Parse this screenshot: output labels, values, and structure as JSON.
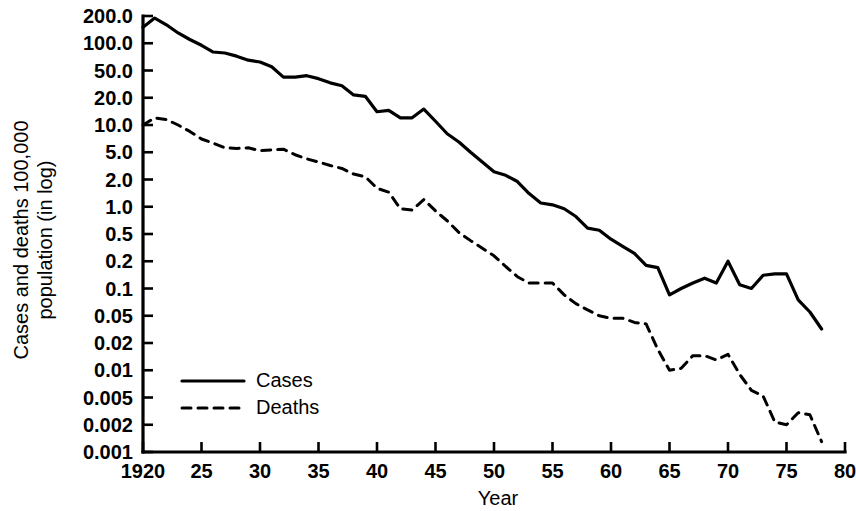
{
  "chart_data": {
    "type": "line",
    "title": "",
    "xlabel": "Year",
    "ylabel": "Cases and deaths 100,000 population (in log)",
    "yscale": "log",
    "ylim": [
      0.001,
      200.0
    ],
    "xlim": [
      1920,
      1980
    ],
    "grid": false,
    "legend_position": "inside-lower-left",
    "y_tick_labels": [
      "200.0",
      "100.0",
      "50.0",
      "20.0",
      "10.0",
      "5.0",
      "2.0",
      "1.0",
      "0.5",
      "0.2",
      "0.1",
      "0.05",
      "0.02",
      "0.01",
      "0.005",
      "0.002",
      "0.001"
    ],
    "y_tick_values": [
      200.0,
      100.0,
      50.0,
      20.0,
      10.0,
      5.0,
      2.0,
      1.0,
      0.5,
      0.2,
      0.1,
      0.05,
      0.02,
      0.01,
      0.005,
      0.002,
      0.001
    ],
    "x_tick_labels": [
      "1920",
      "25",
      "30",
      "35",
      "40",
      "45",
      "50",
      "55",
      "60",
      "65",
      "70",
      "75",
      "80"
    ],
    "x_tick_values": [
      1920,
      1925,
      1930,
      1935,
      1940,
      1945,
      1950,
      1955,
      1960,
      1965,
      1970,
      1975,
      1980
    ],
    "x": [
      1920,
      1921,
      1922,
      1923,
      1924,
      1925,
      1926,
      1927,
      1928,
      1929,
      1930,
      1931,
      1932,
      1933,
      1934,
      1935,
      1936,
      1937,
      1938,
      1939,
      1940,
      1941,
      1942,
      1943,
      1944,
      1945,
      1946,
      1947,
      1948,
      1949,
      1950,
      1951,
      1952,
      1953,
      1954,
      1955,
      1956,
      1957,
      1958,
      1959,
      1960,
      1961,
      1962,
      1963,
      1964,
      1965,
      1966,
      1967,
      1968,
      1969,
      1970,
      1971,
      1972,
      1973,
      1974,
      1975,
      1976,
      1977,
      1978
    ],
    "series": [
      {
        "name": "Cases",
        "style": "solid",
        "color": "#000000",
        "values": [
          150.0,
          190.0,
          160.0,
          130.0,
          110.0,
          95.0,
          80.0,
          78.0,
          72.0,
          65.0,
          62.0,
          55.0,
          40.0,
          40.0,
          42.0,
          38.0,
          33.0,
          30.0,
          22.0,
          21.0,
          14.0,
          14.5,
          12.0,
          12.0,
          15.0,
          11.0,
          8.0,
          6.5,
          5.0,
          3.6,
          2.6,
          2.3,
          1.9,
          1.4,
          1.1,
          1.05,
          0.95,
          0.78,
          0.58,
          0.55,
          0.42,
          0.33,
          0.26,
          0.18,
          0.17,
          0.085,
          0.1,
          0.115,
          0.13,
          0.115,
          0.2,
          0.11,
          0.1,
          0.14,
          0.145,
          0.145,
          0.075,
          0.055,
          0.032
        ]
      },
      {
        "name": "Deaths",
        "style": "dashed",
        "color": "#000000",
        "values": [
          10.0,
          12.0,
          11.5,
          10.0,
          8.5,
          7.0,
          6.3,
          5.6,
          5.5,
          5.6,
          5.2,
          5.3,
          5.4,
          4.6,
          4.0,
          3.6,
          3.2,
          2.9,
          2.4,
          2.2,
          1.6,
          1.45,
          0.95,
          0.92,
          1.2,
          0.9,
          0.7,
          0.52,
          0.4,
          0.31,
          0.24,
          0.175,
          0.135,
          0.115,
          0.115,
          0.115,
          0.085,
          0.068,
          0.058,
          0.05,
          0.046,
          0.046,
          0.04,
          0.038,
          0.017,
          0.01,
          0.0105,
          0.0145,
          0.0145,
          0.013,
          0.015,
          0.009,
          0.006,
          0.0052,
          0.0022,
          0.002,
          0.003,
          0.0028,
          0.0013
        ]
      }
    ]
  },
  "legend": {
    "items": [
      {
        "label": "Cases",
        "style": "solid"
      },
      {
        "label": "Deaths",
        "style": "dashed"
      }
    ]
  }
}
